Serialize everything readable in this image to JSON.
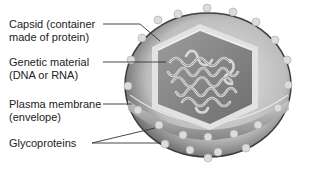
{
  "diagram": {
    "labels": [
      {
        "id": "capsid",
        "line1": "Capsid (container",
        "line2": "made of protein)"
      },
      {
        "id": "genetic",
        "line1": "Genetic material",
        "line2": "(DNA or RNA)"
      },
      {
        "id": "membrane",
        "line1": "Plasma membrane",
        "line2": "(envelope)"
      },
      {
        "id": "glyco",
        "line1": "Glycoproteins",
        "line2": ""
      }
    ]
  },
  "colors": {
    "text": "#222222",
    "leader_line": "#333333",
    "envelope_outer": "#5a5a5a",
    "envelope_light": "#d6d6d6",
    "capsid_face": "#8a8a8a",
    "capsid_edge": "#e6e6e6",
    "nucleic_acid": "#cfcfcf",
    "glycoprotein": "#dcdcdc"
  }
}
